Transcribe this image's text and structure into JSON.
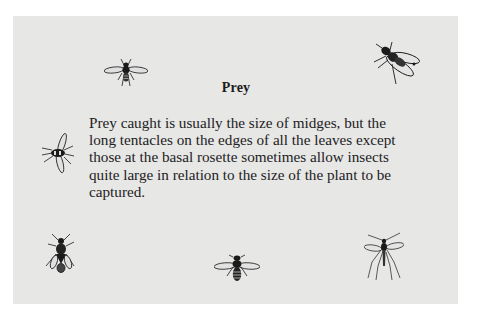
{
  "panel": {
    "background_color": "#e7e7e6",
    "title": "Prey",
    "body_lines": [
      "Prey caught is usually the size of midges, but the",
      "long tentacles on the edges of all the leaves except",
      "those at the basal rosette sometimes allow insects",
      "quite large in relation to the size of the plant to be",
      "captured."
    ]
  },
  "illustrations": [
    {
      "name": "fly-icon",
      "position": "top-left"
    },
    {
      "name": "housefly-icon",
      "position": "top-right"
    },
    {
      "name": "fly-icon",
      "position": "middle-left"
    },
    {
      "name": "fly-icon",
      "position": "bottom-left"
    },
    {
      "name": "wasp-icon",
      "position": "bottom-center"
    },
    {
      "name": "mosquito-icon",
      "position": "bottom-right"
    }
  ]
}
